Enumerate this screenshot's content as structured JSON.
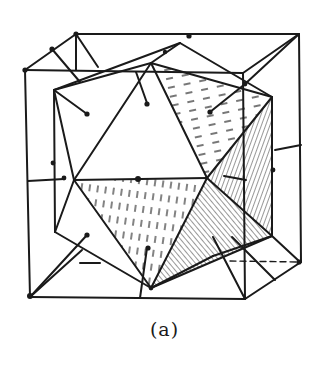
{
  "figure": {
    "caption": "(a)",
    "colors": {
      "ink": "#1a1a1a",
      "background": "#ffffff"
    }
  }
}
